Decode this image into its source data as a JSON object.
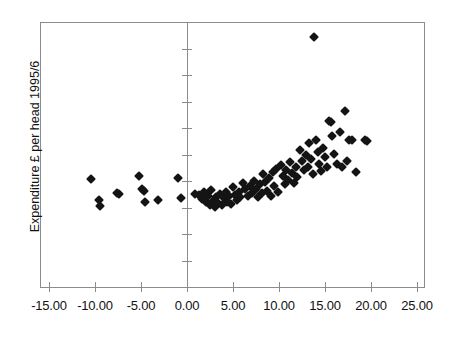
{
  "chart_data": {
    "type": "scatter",
    "title": "",
    "subtitle": "",
    "xlabel": "",
    "ylabel": "Expenditure £ per head 1995/6",
    "xlim": [
      -15,
      25
    ],
    "ylim": [
      0,
      10000
    ],
    "xticks": [
      "-15.00",
      "-10.00",
      "-5.00",
      "0.00",
      "5.00",
      "10.00",
      "15.00",
      "20.00",
      "25.00"
    ],
    "xtick_values": [
      -15,
      -10,
      -5,
      0,
      5,
      10,
      15,
      20,
      25
    ],
    "yticks": [
      "0",
      "1000",
      "2000",
      "3000",
      "4000",
      "5000",
      "6000",
      "7000",
      "8000",
      "9000",
      "10000"
    ],
    "ytick_values": [
      0,
      1000,
      2000,
      3000,
      4000,
      5000,
      6000,
      7000,
      8000,
      9000,
      10000
    ],
    "grid": false,
    "legend": "none",
    "marker": "diamond",
    "marker_color": "#141414",
    "series": [
      {
        "name": "observations",
        "points": [
          [
            -10.4,
            4060
          ],
          [
            -9.6,
            3280
          ],
          [
            -9.5,
            3060
          ],
          [
            -7.6,
            3560
          ],
          [
            -7.4,
            3520
          ],
          [
            -5.2,
            4190
          ],
          [
            -4.9,
            3700
          ],
          [
            -4.7,
            3640
          ],
          [
            -4.6,
            3210
          ],
          [
            -3.2,
            3280
          ],
          [
            -1.0,
            4120
          ],
          [
            -0.6,
            3360
          ],
          [
            0.9,
            3520
          ],
          [
            1.3,
            3460
          ],
          [
            1.6,
            3310
          ],
          [
            1.9,
            3600
          ],
          [
            2.1,
            3190
          ],
          [
            2.3,
            3420
          ],
          [
            2.5,
            3090
          ],
          [
            2.6,
            3650
          ],
          [
            2.8,
            3260
          ],
          [
            3.0,
            3010
          ],
          [
            3.2,
            3380
          ],
          [
            3.4,
            3160
          ],
          [
            3.6,
            3520
          ],
          [
            3.8,
            3080
          ],
          [
            4.0,
            3340
          ],
          [
            4.2,
            3600
          ],
          [
            4.4,
            3220
          ],
          [
            4.6,
            3440
          ],
          [
            4.8,
            3130
          ],
          [
            5.0,
            3760
          ],
          [
            5.2,
            3490
          ],
          [
            5.4,
            3270
          ],
          [
            5.6,
            3580
          ],
          [
            5.8,
            3380
          ],
          [
            6.1,
            3930
          ],
          [
            6.3,
            3680
          ],
          [
            6.6,
            3450
          ],
          [
            6.9,
            3820
          ],
          [
            7.1,
            3560
          ],
          [
            7.3,
            4000
          ],
          [
            7.5,
            3700
          ],
          [
            7.7,
            3380
          ],
          [
            7.9,
            3880
          ],
          [
            8.1,
            3540
          ],
          [
            8.3,
            4260
          ],
          [
            8.5,
            3960
          ],
          [
            8.7,
            3640
          ],
          [
            8.9,
            4110
          ],
          [
            9.1,
            3420
          ],
          [
            9.3,
            4350
          ],
          [
            9.5,
            3800
          ],
          [
            9.7,
            4470
          ],
          [
            9.9,
            3590
          ],
          [
            10.2,
            4600
          ],
          [
            10.4,
            4180
          ],
          [
            10.6,
            3880
          ],
          [
            10.8,
            4420
          ],
          [
            11.0,
            4020
          ],
          [
            11.2,
            4720
          ],
          [
            11.4,
            4300
          ],
          [
            11.6,
            3940
          ],
          [
            11.8,
            4540
          ],
          [
            12.0,
            4160
          ],
          [
            12.3,
            5180
          ],
          [
            12.5,
            4760
          ],
          [
            12.7,
            4400
          ],
          [
            12.9,
            4980
          ],
          [
            13.1,
            4520
          ],
          [
            13.3,
            5420
          ],
          [
            13.5,
            4840
          ],
          [
            13.7,
            4280
          ],
          [
            13.8,
            9450
          ],
          [
            14.0,
            5560
          ],
          [
            14.2,
            5080
          ],
          [
            14.4,
            4640
          ],
          [
            14.6,
            4380
          ],
          [
            14.8,
            5260
          ],
          [
            15.0,
            4900
          ],
          [
            15.2,
            4520
          ],
          [
            15.4,
            6280
          ],
          [
            15.6,
            6240
          ],
          [
            15.8,
            5700
          ],
          [
            16.0,
            5020
          ],
          [
            16.3,
            4660
          ],
          [
            16.6,
            5860
          ],
          [
            16.9,
            4520
          ],
          [
            17.2,
            6640
          ],
          [
            17.4,
            4740
          ],
          [
            17.6,
            5540
          ],
          [
            17.9,
            5540
          ],
          [
            18.4,
            4340
          ],
          [
            19.3,
            5540
          ],
          [
            19.6,
            5520
          ]
        ]
      }
    ]
  },
  "axes": {
    "y_title": "Expenditure £ per head 1995/6"
  }
}
